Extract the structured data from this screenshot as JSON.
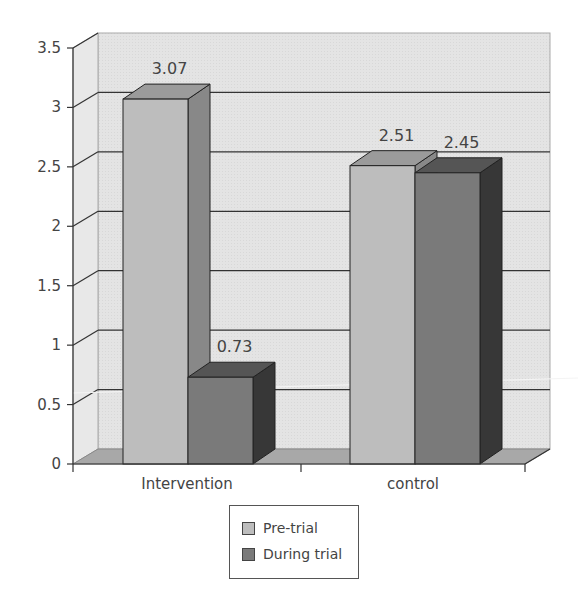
{
  "chart_data": {
    "type": "bar",
    "style": "3d-clustered-column",
    "title": "",
    "xlabel": "",
    "ylabel": "",
    "categories": [
      "Intervention",
      "control"
    ],
    "series": [
      {
        "name": "Pre-trial",
        "values": [
          3.07,
          2.51
        ],
        "color": "#bdbdbd"
      },
      {
        "name": "During trial",
        "values": [
          0.73,
          2.45
        ],
        "color": "#7a7a7a"
      }
    ],
    "data_labels": [
      [
        "3.07",
        "2.51"
      ],
      [
        "0.73",
        "2.45"
      ]
    ],
    "ylim": [
      0,
      3.5
    ],
    "yticks": [
      "0",
      "0.5",
      "1",
      "1.5",
      "2",
      "2.5",
      "3",
      "3.5"
    ],
    "grid": true,
    "legend_position": "bottom"
  },
  "legend": {
    "items": [
      {
        "label": "Pre-trial"
      },
      {
        "label": "During trial"
      }
    ]
  }
}
